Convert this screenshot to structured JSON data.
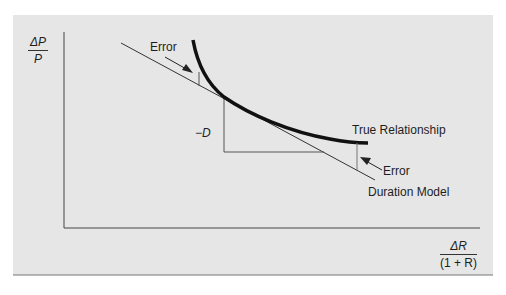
{
  "figure": {
    "background_color": "#e6e6e6",
    "curve_color": "#111111",
    "line_color": "#333333",
    "y_axis_label": {
      "numerator": "ΔP",
      "denominator": "P"
    },
    "x_axis_label": {
      "numerator": "ΔR",
      "denominator": "(1 + R)"
    },
    "labels": {
      "error_top": "Error",
      "error_bottom": "Error",
      "slope": "−D",
      "true_relationship": "True Relationship",
      "duration_model": "Duration Model"
    }
  }
}
